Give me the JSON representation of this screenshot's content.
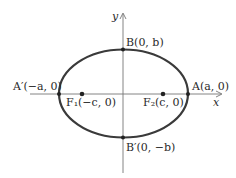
{
  "diagram": {
    "type": "ellipse",
    "axes": {
      "x_label": "x",
      "y_label": "y"
    },
    "points": {
      "vertex_right": "A(a, 0)",
      "vertex_left": "A′(−a, 0)",
      "covertex_top": "B(0, b)",
      "covertex_bottom": "B′(0, −b)",
      "focus_left": "F₁(−c, 0)",
      "focus_right": "F₂(c, 0)"
    },
    "colors": {
      "curve": "#3a3a3a",
      "axis": "#777777",
      "text": "#2a2a2a"
    }
  }
}
